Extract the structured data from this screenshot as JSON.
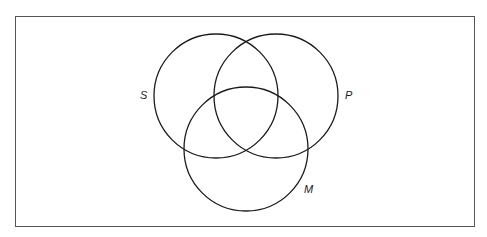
{
  "diagram": {
    "type": "venn",
    "frame": {
      "x": 15,
      "y": 16,
      "width": 459,
      "height": 210,
      "stroke": "#555555"
    },
    "circles": [
      {
        "id": "S",
        "label": "S",
        "cx": 216,
        "cy": 96,
        "r": 62,
        "label_x": 140,
        "label_y": 99
      },
      {
        "id": "P",
        "label": "P",
        "cx": 276,
        "cy": 96,
        "r": 62,
        "label_x": 345,
        "label_y": 99
      },
      {
        "id": "M",
        "label": "M",
        "cx": 246,
        "cy": 149,
        "r": 62,
        "label_x": 304,
        "label_y": 193
      }
    ],
    "stroke_color": "#1a1a1a"
  }
}
